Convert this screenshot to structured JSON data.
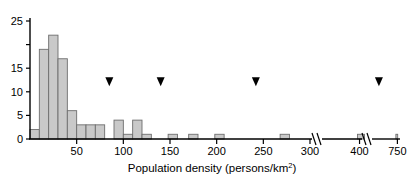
{
  "chart_data": {
    "type": "bar",
    "title": "",
    "xlabel": "Population density (persons/km2)",
    "xlabel_main": "Population density (persons/km",
    "xlabel_sup": "2",
    "xlabel_tail": ")",
    "ylabel": "",
    "ylim": [
      0,
      25
    ],
    "xlim": [
      0,
      300
    ],
    "grid": false,
    "legend": null,
    "bin_width": 10,
    "y_ticks": [
      0,
      5,
      10,
      15,
      20,
      25
    ],
    "y_tick_labels": [
      "0",
      "5",
      "10",
      "15",
      "",
      "25"
    ],
    "x_ticks": [
      50,
      100,
      150,
      200,
      250,
      300,
      400,
      750
    ],
    "x_tick_labels": [
      "50",
      "100",
      "150",
      "200",
      "250",
      "300",
      "400",
      "750"
    ],
    "axis_breaks": [
      310,
      430
    ],
    "bars": [
      {
        "x0": 0,
        "x1": 10,
        "height": 2
      },
      {
        "x0": 10,
        "x1": 20,
        "height": 19
      },
      {
        "x0": 20,
        "x1": 30,
        "height": 22
      },
      {
        "x0": 30,
        "x1": 40,
        "height": 17
      },
      {
        "x0": 40,
        "x1": 50,
        "height": 6
      },
      {
        "x0": 50,
        "x1": 60,
        "height": 3
      },
      {
        "x0": 60,
        "x1": 70,
        "height": 3
      },
      {
        "x0": 70,
        "x1": 80,
        "height": 3
      },
      {
        "x0": 90,
        "x1": 100,
        "height": 4
      },
      {
        "x0": 100,
        "x1": 110,
        "height": 1
      },
      {
        "x0": 110,
        "x1": 120,
        "height": 4
      },
      {
        "x0": 120,
        "x1": 130,
        "height": 1
      },
      {
        "x0": 148,
        "x1": 158,
        "height": 1
      },
      {
        "x0": 170,
        "x1": 180,
        "height": 1
      },
      {
        "x0": 198,
        "x1": 208,
        "height": 1
      },
      {
        "x0": 268,
        "x1": 278,
        "height": 1
      },
      {
        "x0": 395,
        "x1": 412,
        "height": 1
      },
      {
        "x0": 725,
        "x1": 755,
        "height": 1
      }
    ],
    "markers": [
      {
        "value": 85,
        "y": 12,
        "shape": "down-triangle"
      },
      {
        "value": 140,
        "y": 12,
        "shape": "down-triangle"
      },
      {
        "value": 242,
        "y": 12,
        "shape": "down-triangle"
      },
      {
        "value": 445,
        "y": 12,
        "shape": "down-triangle"
      }
    ],
    "colors": {
      "bar_fill": "#c9c9c9",
      "bar_edge": "#6e6e6e",
      "axis": "#000000",
      "marker": "#000000",
      "background": "#ffffff"
    }
  }
}
